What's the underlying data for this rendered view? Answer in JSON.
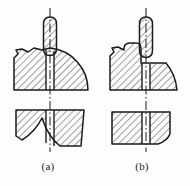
{
  "figure": {
    "type": "engineering-section-drawing",
    "line_color": "#1a1a1a",
    "hatch_color": "#2a2a2a",
    "background": "#fdfdfd",
    "hatch_angle_deg": 45,
    "panels": [
      {
        "id": "a",
        "caption": "(a)",
        "tool": {
          "name": "drill-bit",
          "hatched": true,
          "center_x": 50,
          "top": 18,
          "bottom": 55,
          "width": 13,
          "centerline_top": 8
        },
        "upper_view": {
          "name": "workpiece-upper-view-a",
          "shape": "quarter-arc-with-break",
          "hole_center_x": 50,
          "hole_width": 8,
          "top": 48,
          "bottom": 90
        },
        "lower_view": {
          "name": "workpiece-lower-view-a",
          "shape": "trapezoid-concave-base",
          "hole_center_x": 50,
          "hole_width": 8,
          "top": 110,
          "bottom": 146
        },
        "centerline": {
          "name": "centre-line-a",
          "x": 50,
          "top": 8,
          "bottom": 152,
          "style": "dash-dot"
        }
      },
      {
        "id": "b",
        "caption": "(b)",
        "tool": {
          "name": "drill-bit",
          "hatched": true,
          "center_x": 146,
          "top": 18,
          "bottom": 57,
          "width": 13,
          "centerline_top": 8
        },
        "upper_view": {
          "name": "workpiece-upper-view-b",
          "shape": "stepped-boss-with-chamfer",
          "hole_center_x": 146,
          "hole_width": 8,
          "top": 47,
          "bottom": 90
        },
        "lower_view": {
          "name": "workpiece-lower-view-b",
          "shape": "rectangle-with-notched-corner",
          "hole_center_x": 146,
          "hole_width": 8,
          "top": 112,
          "bottom": 144
        },
        "centerline": {
          "name": "centre-line-b",
          "x": 146,
          "top": 8,
          "bottom": 152,
          "style": "dash-dot"
        }
      }
    ]
  }
}
